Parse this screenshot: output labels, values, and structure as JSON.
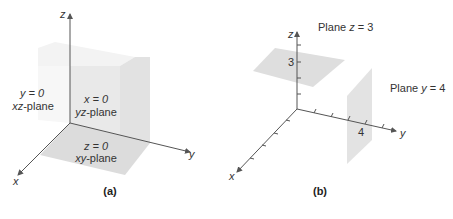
{
  "panel_a": {
    "caption": "(a)",
    "axes": {
      "x": "x",
      "y": "y",
      "z": "z"
    },
    "planes": [
      {
        "equation": "y = 0",
        "name": "xz-plane"
      },
      {
        "equation": "x = 0",
        "name": "yz-plane"
      },
      {
        "equation": "z = 0",
        "name": "xy-plane"
      }
    ]
  },
  "panel_b": {
    "caption": "(b)",
    "axes": {
      "x": "x",
      "y": "y",
      "z": "z"
    },
    "tick_labels": {
      "z": "3",
      "y": "4"
    },
    "planes": [
      {
        "label": "Plane z = 3"
      },
      {
        "label": "Plane y = 4"
      }
    ]
  },
  "colors": {
    "plane_light": "#f1f1f1",
    "plane_mid": "#dedede",
    "plane_dark": "#e6e6e6",
    "axis": "#555555",
    "text": "#333333"
  }
}
